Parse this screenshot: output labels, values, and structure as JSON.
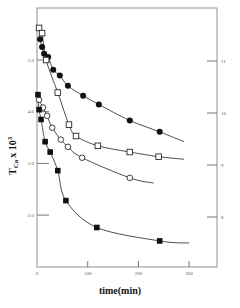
{
  "chart_data": {
    "type": "scatter",
    "title": "",
    "xlabel": "time(min)",
    "ylabel": "T_Ca x 10^3",
    "ylabel_main": "T",
    "ylabel_sub": "Ca",
    "ylabel_mult": "x 10",
    "ylabel_exp": "3",
    "xlim": [
      0,
      300
    ],
    "ylim_left": [
      1.0,
      5.7
    ],
    "ylim_right": [
      7.0,
      11.7
    ],
    "x_ticks": [
      0,
      100,
      200,
      300
    ],
    "x_tick_labels": [
      "0",
      "100",
      "200",
      "300"
    ],
    "y_left_ticks": [
      5.0,
      4.0,
      3.0,
      2.0
    ],
    "y_left_tick_labels": [
      "5.0",
      "4.0",
      "3.0",
      "2.0"
    ],
    "y_right_ticks": [
      11,
      10,
      9,
      8
    ],
    "y_right_tick_labels": [
      "11",
      "10",
      "9",
      "8"
    ],
    "grid": false,
    "legend": "none",
    "series": [
      {
        "name": "filled circles",
        "marker": "filled-circle",
        "points": [
          [
            6,
            5.4
          ],
          [
            10,
            5.25
          ],
          [
            14,
            5.12
          ],
          [
            22,
            5.06
          ],
          [
            32,
            4.81
          ],
          [
            45,
            4.7
          ],
          [
            61,
            4.5
          ],
          [
            91,
            4.31
          ],
          [
            122,
            4.14
          ],
          [
            183,
            3.83
          ],
          [
            242,
            3.61
          ]
        ]
      },
      {
        "name": "open squares",
        "marker": "open-square",
        "points": [
          [
            4,
            5.62
          ],
          [
            10,
            5.52
          ],
          [
            18,
            5.0
          ],
          [
            41,
            4.37
          ],
          [
            63,
            3.75
          ],
          [
            77,
            3.53
          ],
          [
            120,
            3.34
          ],
          [
            183,
            3.22
          ],
          [
            240,
            3.13
          ]
        ]
      },
      {
        "name": "open circles",
        "marker": "open-circle",
        "points": [
          [
            4,
            4.23
          ],
          [
            12,
            4.08
          ],
          [
            20,
            3.92
          ],
          [
            30,
            3.69
          ],
          [
            47,
            3.46
          ],
          [
            61,
            3.32
          ],
          [
            89,
            3.11
          ],
          [
            183,
            2.72
          ]
        ]
      },
      {
        "name": "filled squares",
        "marker": "filled-square",
        "points": [
          [
            2,
            4.33
          ],
          [
            4,
            4.04
          ],
          [
            8,
            3.85
          ],
          [
            16,
            3.42
          ],
          [
            26,
            3.22
          ],
          [
            41,
            2.86
          ],
          [
            57,
            2.28
          ],
          [
            118,
            1.76
          ],
          [
            242,
            1.5
          ]
        ]
      }
    ]
  }
}
